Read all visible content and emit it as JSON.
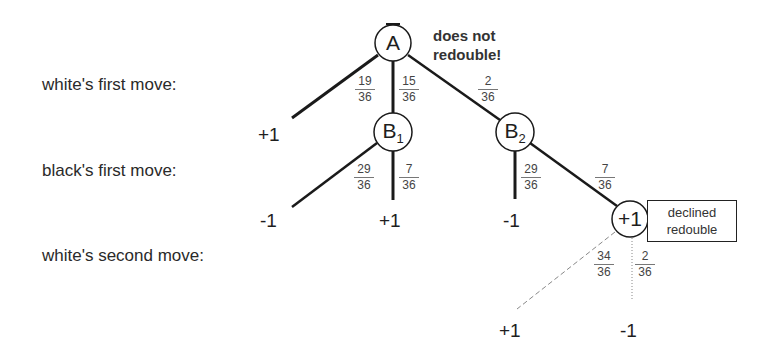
{
  "diagram": {
    "row_labels": {
      "white_first": "white's first move:",
      "black_first": "black's first move:",
      "white_second": "white's second move:"
    },
    "nodes": {
      "a": {
        "label": "A",
        "sub": ""
      },
      "b1": {
        "label": "B",
        "sub": "1"
      },
      "b2": {
        "label": "B",
        "sub": "2"
      },
      "plus1": {
        "label": "+1",
        "sub": ""
      }
    },
    "annotation": {
      "line1": "does not",
      "line2": "redouble!"
    },
    "declined_box": {
      "line1": "declined",
      "line2": "redouble"
    },
    "probabilities": {
      "a_left": {
        "num": "19",
        "den": "36"
      },
      "a_mid": {
        "num": "15",
        "den": "36"
      },
      "a_right": {
        "num": "2",
        "den": "36"
      },
      "b1_left": {
        "num": "29",
        "den": "36"
      },
      "b1_right": {
        "num": "7",
        "den": "36"
      },
      "b2_left": {
        "num": "29",
        "den": "36"
      },
      "b2_right": {
        "num": "7",
        "den": "36"
      },
      "p_left": {
        "num": "34",
        "den": "36"
      },
      "p_right": {
        "num": "2",
        "den": "36"
      }
    },
    "leaves": {
      "a_left": "+1",
      "b1_left": "-1",
      "b1_right": "+1",
      "b2_left": "-1",
      "p_left": "+1",
      "p_right": "-1"
    }
  }
}
